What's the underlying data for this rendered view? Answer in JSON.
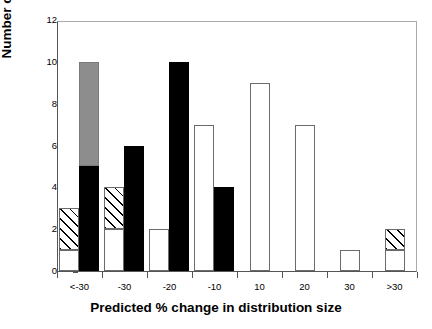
{
  "chart_data": {
    "type": "bar",
    "title": "",
    "xlabel": "Predicted % change in distribution size",
    "ylabel": "Number of species",
    "categories": [
      "<-30",
      "-30",
      "-20",
      "-10",
      "10",
      "20",
      "30",
      ">30"
    ],
    "ylim": [
      0,
      12
    ],
    "y_ticks": [
      0,
      2,
      4,
      6,
      8,
      10,
      12
    ],
    "grid": false,
    "legend": "none",
    "stacked": true,
    "bar_groups": [
      {
        "category": "<-30",
        "bars": [
          {
            "name": "bar-1a",
            "total": 3,
            "segments": [
              {
                "fill": "white",
                "value": 1
              },
              {
                "fill": "hatch",
                "value": 2
              }
            ]
          },
          {
            "name": "bar-1b",
            "total": 10,
            "segments": [
              {
                "fill": "black",
                "value": 5
              },
              {
                "fill": "gray",
                "value": 5
              }
            ]
          }
        ]
      },
      {
        "category": "-30",
        "bars": [
          {
            "name": "bar-2a",
            "total": 4,
            "segments": [
              {
                "fill": "white",
                "value": 2
              },
              {
                "fill": "hatch",
                "value": 2
              }
            ]
          },
          {
            "name": "bar-2b",
            "total": 6,
            "segments": [
              {
                "fill": "black",
                "value": 6
              }
            ]
          }
        ]
      },
      {
        "category": "-20",
        "bars": [
          {
            "name": "bar-3a",
            "total": 2,
            "segments": [
              {
                "fill": "white",
                "value": 2
              }
            ]
          },
          {
            "name": "bar-3b",
            "total": 10,
            "segments": [
              {
                "fill": "black",
                "value": 10
              }
            ]
          }
        ]
      },
      {
        "category": "-10",
        "bars": [
          {
            "name": "bar-4a",
            "total": 7,
            "segments": [
              {
                "fill": "white",
                "value": 7
              }
            ]
          },
          {
            "name": "bar-4b",
            "total": 4,
            "segments": [
              {
                "fill": "black",
                "value": 4
              }
            ]
          }
        ]
      },
      {
        "category": "10",
        "bars": [
          {
            "name": "bar-5a",
            "total": 9,
            "segments": [
              {
                "fill": "white",
                "value": 9
              }
            ]
          }
        ]
      },
      {
        "category": "20",
        "bars": [
          {
            "name": "bar-6a",
            "total": 7,
            "segments": [
              {
                "fill": "white",
                "value": 7
              }
            ]
          }
        ]
      },
      {
        "category": "30",
        "bars": [
          {
            "name": "bar-7a",
            "total": 1,
            "segments": [
              {
                "fill": "white",
                "value": 1
              }
            ]
          }
        ]
      },
      {
        "category": ">30",
        "bars": [
          {
            "name": "bar-8a",
            "total": 2,
            "segments": [
              {
                "fill": "white",
                "value": 1
              },
              {
                "fill": "hatch",
                "value": 1
              }
            ]
          }
        ]
      }
    ],
    "colors": {
      "white": "#ffffff",
      "black": "#000000",
      "gray": "#8d8d8d",
      "hatch": "#ffffff",
      "outline": "#6b6b6b",
      "axis": "#555555",
      "text": "#000000"
    }
  }
}
